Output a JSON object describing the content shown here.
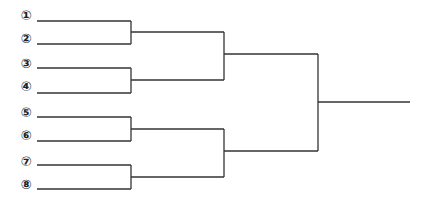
{
  "diagram": {
    "type": "tournament-bracket",
    "line_color": "#333333",
    "seeds": [
      {
        "label": "①",
        "number": 1
      },
      {
        "label": "②",
        "number": 2
      },
      {
        "label": "③",
        "number": 3
      },
      {
        "label": "④",
        "number": 4
      },
      {
        "label": "⑤",
        "number": 5
      },
      {
        "label": "⑥",
        "number": 6
      },
      {
        "label": "⑦",
        "number": 7
      },
      {
        "label": "⑧",
        "number": 8
      }
    ],
    "rounds": [
      {
        "name": "round-1",
        "matches": [
          [
            "1",
            "2"
          ],
          [
            "3",
            "4"
          ],
          [
            "5",
            "6"
          ],
          [
            "7",
            "8"
          ]
        ]
      },
      {
        "name": "semifinal",
        "matches": [
          [
            "W1",
            "W2"
          ],
          [
            "W3",
            "W4"
          ]
        ]
      },
      {
        "name": "final",
        "matches": [
          [
            "W5",
            "W6"
          ]
        ]
      }
    ]
  }
}
